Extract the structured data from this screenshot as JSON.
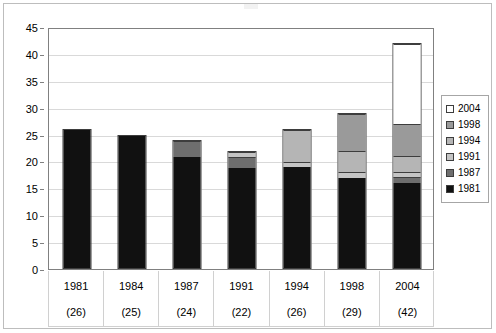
{
  "chart_data": {
    "type": "bar",
    "subtype": "stacked-column",
    "title": "",
    "xlabel": "",
    "ylabel": "",
    "ylim": [
      0,
      45
    ],
    "ytick_step": 5,
    "yticks": [
      0,
      5,
      10,
      15,
      20,
      25,
      30,
      35,
      40,
      45
    ],
    "ytick_labels": [
      "0",
      "5",
      "10",
      "15",
      "20",
      "25",
      "30",
      "35",
      "40",
      "45"
    ],
    "grid": true,
    "grid_axis": "y",
    "legend_position": "right",
    "categories": [
      "1981",
      "1984",
      "1987",
      "1991",
      "1994",
      "1998",
      "2004"
    ],
    "category_sublabels": [
      "(26)",
      "(25)",
      "(24)",
      "(22)",
      "(26)",
      "(29)",
      "(42)"
    ],
    "category_totals": [
      26,
      25,
      24,
      22,
      26,
      29,
      42
    ],
    "series": [
      {
        "name": "1981",
        "color": "#111111",
        "values": [
          26,
          25,
          21,
          19,
          19,
          17,
          16
        ]
      },
      {
        "name": "1987",
        "color": "#6e6e6e",
        "values": [
          0,
          0,
          3,
          2,
          0,
          0,
          1
        ]
      },
      {
        "name": "1991",
        "color": "#c4c4c4",
        "values": [
          0,
          0,
          0,
          1,
          1,
          1,
          1
        ]
      },
      {
        "name": "1994",
        "color": "#b5b5b5",
        "values": [
          0,
          0,
          0,
          0,
          6,
          4,
          3
        ]
      },
      {
        "name": "1998",
        "color": "#9a9a9a",
        "values": [
          0,
          0,
          0,
          0,
          0,
          7,
          6
        ]
      },
      {
        "name": "2004",
        "color": "#ffffff",
        "values": [
          0,
          0,
          0,
          0,
          0,
          0,
          15
        ]
      }
    ]
  },
  "legend": {
    "items": [
      {
        "label": "2004",
        "color": "#ffffff"
      },
      {
        "label": "1998",
        "color": "#9a9a9a"
      },
      {
        "label": "1994",
        "color": "#b5b5b5"
      },
      {
        "label": "1991",
        "color": "#c4c4c4"
      },
      {
        "label": "1987",
        "color": "#6e6e6e"
      },
      {
        "label": "1981",
        "color": "#111111"
      }
    ]
  },
  "colors": {
    "plot_border": "#808080",
    "frame_border": "#bdbdbd",
    "gridline": "#d9d9d9",
    "bar_outline": "#3d3d3d",
    "text": "#000000",
    "background": "#ffffff"
  }
}
